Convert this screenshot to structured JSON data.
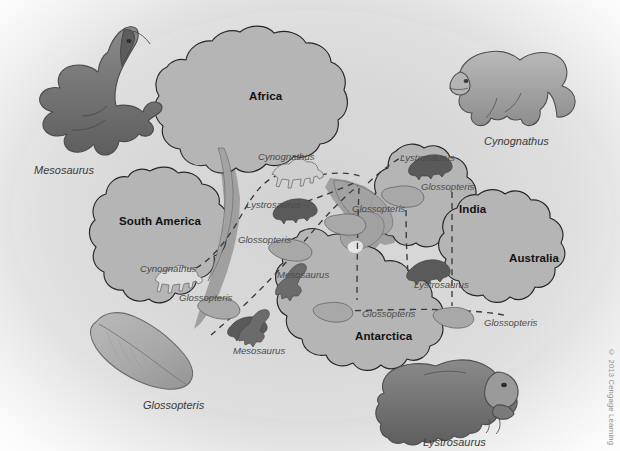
{
  "figure": {
    "copyright": "© 2013 Cengage Learning"
  },
  "palette": {
    "background_center": "#d3d3d3",
    "background_edge": "#ffffff",
    "landmass_fill": "#b5b5b5",
    "landmass_stroke": "#2b2b2b",
    "shelf_fill": "#9d9d9d",
    "fossil_line": "#4a4a4a",
    "creature_dark": "#6e6e6e",
    "creature_mid": "#9a9a9a",
    "creature_light": "#c6c6c6",
    "leaf_fill": "#b0b0b0",
    "label_dark": "#121212",
    "label_italic": "#3c3c3c"
  },
  "continents": [
    {
      "name": "Africa",
      "x": 249,
      "y": 90
    },
    {
      "name": "South America",
      "x": 119,
      "y": 215
    },
    {
      "name": "India",
      "x": 459,
      "y": 203
    },
    {
      "name": "Australia",
      "x": 509,
      "y": 252
    },
    {
      "name": "Antarctica",
      "x": 355,
      "y": 330
    }
  ],
  "map_fossil_labels": [
    {
      "taxon": "Cynognathus",
      "x": 258,
      "y": 151,
      "continent": "Africa"
    },
    {
      "taxon": "Lystrosaurus",
      "x": 246,
      "y": 199,
      "continent": "Africa"
    },
    {
      "taxon": "Glossopteris",
      "x": 238,
      "y": 234,
      "continent": "Africa"
    },
    {
      "taxon": "Cynognathus",
      "x": 140,
      "y": 263,
      "continent": "South America"
    },
    {
      "taxon": "Glossopteris",
      "x": 179,
      "y": 292,
      "continent": "South America"
    },
    {
      "taxon": "Mesosaurus",
      "x": 277,
      "y": 269,
      "continent": "South America / Africa"
    },
    {
      "taxon": "Mesosaurus",
      "x": 233,
      "y": 345,
      "continent": "South America"
    },
    {
      "taxon": "Lystrosaurus",
      "x": 400,
      "y": 155,
      "continent": "India"
    },
    {
      "taxon": "Glossopteris",
      "x": 421,
      "y": 184,
      "continent": "India"
    },
    {
      "taxon": "Glossopteris",
      "x": 355,
      "y": 208,
      "continent": "India shelf"
    },
    {
      "taxon": "Lystrosaurus",
      "x": 414,
      "y": 282,
      "continent": "Antarctica"
    },
    {
      "taxon": "Glossopteris",
      "x": 362,
      "y": 311,
      "continent": "Antarctica"
    },
    {
      "taxon": "Glossopteris",
      "x": 484,
      "y": 320,
      "continent": "Australia"
    }
  ],
  "illustrations": [
    {
      "taxon": "Mesosaurus",
      "label_x": 34,
      "label_y": 164,
      "kind": "aquatic-reptile"
    },
    {
      "taxon": "Cynognathus",
      "label_x": 484,
      "label_y": 135,
      "kind": "therapsid"
    },
    {
      "taxon": "Glossopteris",
      "label_x": 143,
      "label_y": 399,
      "kind": "leaf"
    },
    {
      "taxon": "Lystrosaurus",
      "label_x": 423,
      "label_y": 436,
      "kind": "dicynodont"
    }
  ]
}
